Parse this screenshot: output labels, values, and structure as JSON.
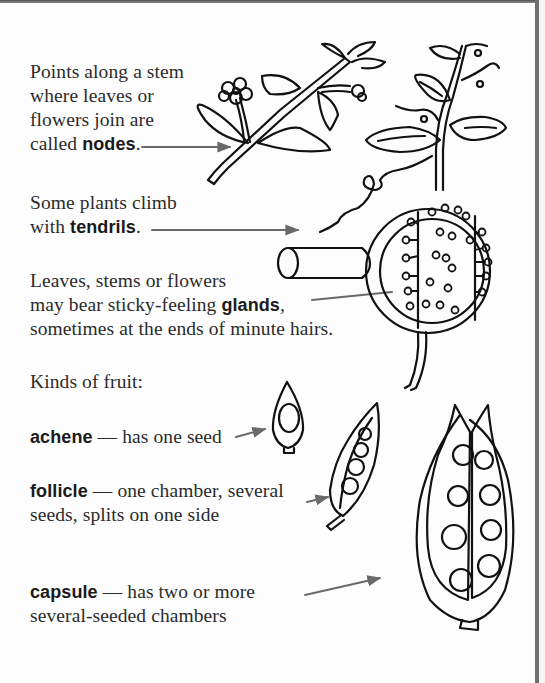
{
  "nodes": {
    "lines": [
      "Points along a stem",
      "where leaves or",
      "flowers join are"
    ],
    "prefix": "called ",
    "term": "nodes",
    "suffix": "."
  },
  "tendrils": {
    "line1": "Some plants climb",
    "prefix": "with ",
    "term": "tendrils",
    "suffix": "."
  },
  "glands": {
    "line1": "Leaves, stems or flowers",
    "prefix": "may bear sticky-feeling ",
    "term": "glands",
    "suffix": ",",
    "line3": "sometimes at the ends of minute hairs."
  },
  "fruit_heading": "Kinds of fruit:",
  "fruits": [
    {
      "term": "achene",
      "dash": " — ",
      "desc": "has one seed",
      "desc2": ""
    },
    {
      "term": "follicle",
      "dash": " — ",
      "desc": "one chamber, several",
      "desc2": "seeds, splits on one side"
    },
    {
      "term": "capsule",
      "dash": " — ",
      "desc": "has two or more",
      "desc2": "several-seeded chambers"
    }
  ],
  "colors": {
    "ink": "#111111",
    "text": "#2b2b2b",
    "arrow": "#6a6a6a",
    "border": "#6e6e6e"
  }
}
